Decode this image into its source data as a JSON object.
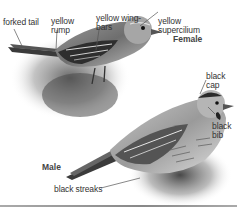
{
  "figure": {
    "female": {
      "sex_label": "Female",
      "labels": [
        {
          "id": "forked-tail",
          "text": "forked tail"
        },
        {
          "id": "yellow-rump",
          "text": "yellow\nrump"
        },
        {
          "id": "yellow-wing-bars",
          "text": "yellow wing-\nbars"
        },
        {
          "id": "yellow-supercilium",
          "text": "yellow\nsupercilium"
        }
      ]
    },
    "male": {
      "sex_label": "Male",
      "labels": [
        {
          "id": "black-cap",
          "text": "black\ncap"
        },
        {
          "id": "black-bib",
          "text": "black\nbib"
        },
        {
          "id": "black-streaks",
          "text": "black streaks"
        }
      ]
    },
    "colors": {
      "label_text": "#333333",
      "leader_line": "#555555",
      "rule": "#999999"
    }
  }
}
